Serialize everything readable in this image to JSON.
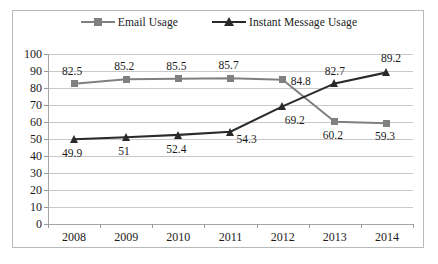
{
  "chart_data": {
    "type": "line",
    "title": "",
    "subtitle": "",
    "xlabel": "",
    "ylabel": "",
    "categories": [
      "2008",
      "2009",
      "2010",
      "2011",
      "2012",
      "2013",
      "2014"
    ],
    "ylim": [
      0,
      100
    ],
    "yticks": [
      "100",
      "90",
      "80",
      "70",
      "60",
      "50",
      "40",
      "30",
      "20",
      "10",
      "0"
    ],
    "grid": "horizontal",
    "legend_position": "top-center",
    "series": [
      {
        "name": "Email Usage",
        "color": "#808080",
        "marker": "square",
        "values": [
          82.5,
          85.2,
          85.5,
          85.7,
          84.8,
          60.2,
          59.3
        ],
        "labels": [
          "82.5",
          "85.2",
          "85.5",
          "85.7",
          "84.8",
          "60.2",
          "59.3"
        ]
      },
      {
        "name": "Instant Message Usage",
        "color": "#2a2a2a",
        "marker": "triangle",
        "values": [
          49.9,
          51,
          52.4,
          54.3,
          69.2,
          82.7,
          89.2
        ],
        "labels": [
          "49.9",
          "51",
          "52.4",
          "54.3",
          "69.2",
          "82.7",
          "89.2"
        ]
      }
    ]
  },
  "legend": {
    "entries": [
      {
        "label": "Email Usage"
      },
      {
        "label": "Instant Message Usage"
      }
    ]
  },
  "colors": {
    "email_series": "#808080",
    "im_series": "#2a2a2a",
    "gridline": "#c8c8c8",
    "axis": "#a6a6a6",
    "frame": "#b9b9b9",
    "text": "#1b1b1b",
    "background": "#ffffff"
  }
}
